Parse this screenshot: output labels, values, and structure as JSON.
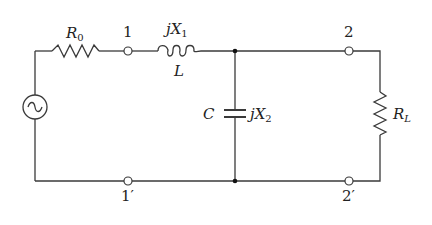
{
  "diagram": {
    "type": "circuit",
    "colors": {
      "line": "#3a3a3a",
      "background": "#ffffff",
      "junction": "#111111"
    },
    "components": {
      "source": {
        "symbol": "ac-source",
        "label": ""
      },
      "r0": {
        "prefix": "R",
        "sub": "0"
      },
      "inductor": {
        "reactance_prefix": "jX",
        "reactance_sub": "1",
        "name": "L"
      },
      "capacitor": {
        "name": "C",
        "reactance_prefix": "jX",
        "reactance_sub": "2"
      },
      "load": {
        "prefix": "R",
        "sub": "L"
      }
    },
    "terminals": {
      "t1": "1",
      "t1p": "1′",
      "t2": "2",
      "t2p": "2′"
    }
  }
}
